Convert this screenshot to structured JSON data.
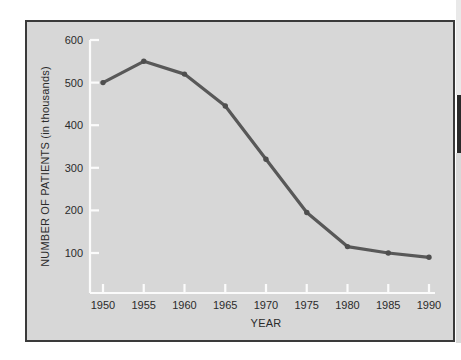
{
  "figure": {
    "background_color": "#d7d7d7",
    "frame_color": "#3a3a3a",
    "line_color": "#585858",
    "axis_color": "#fbfbfb",
    "text_color": "#2b2b2b"
  },
  "chart_data": {
    "type": "line",
    "title": "",
    "xlabel": "YEAR",
    "ylabel": "NUMBER OF PATIENTS (in thousands)",
    "x": [
      1950,
      1955,
      1960,
      1965,
      1970,
      1975,
      1980,
      1985,
      1990
    ],
    "categories": [
      "1950",
      "1955",
      "1960",
      "1965",
      "1970",
      "1975",
      "1980",
      "1985",
      "1990"
    ],
    "values": [
      500,
      550,
      520,
      445,
      320,
      195,
      115,
      100,
      90
    ],
    "series": [
      {
        "name": "Number of patients",
        "values": [
          500,
          550,
          520,
          445,
          320,
          195,
          115,
          100,
          90
        ]
      }
    ],
    "xlim": [
      1950,
      1990
    ],
    "ylim": [
      0,
      600
    ],
    "xticks": [
      "1950",
      "1955",
      "1960",
      "1965",
      "1970",
      "1975",
      "1980",
      "1985",
      "1990"
    ],
    "yticks": [
      "100",
      "200",
      "300",
      "400",
      "500",
      "600"
    ],
    "ytick_values": [
      100,
      200,
      300,
      400,
      500,
      600
    ],
    "grid": false,
    "legend": false,
    "markers": true
  }
}
